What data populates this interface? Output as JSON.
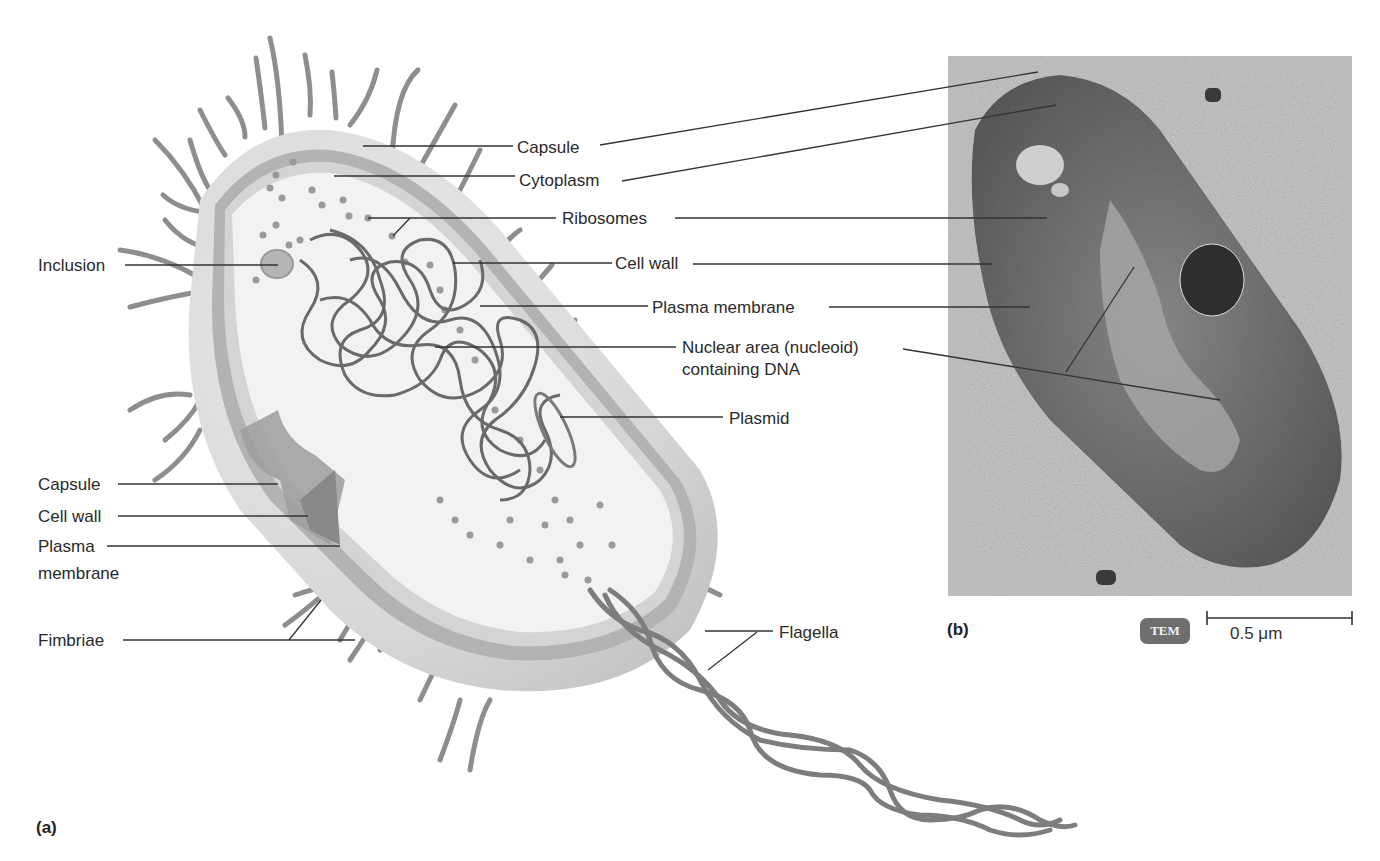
{
  "figure": {
    "panel_a_label": "(a)",
    "panel_b_label": "(b)",
    "diagram_labels": {
      "capsule_top": "Capsule",
      "cytoplasm": "Cytoplasm",
      "ribosomes": "Ribosomes",
      "inclusion": "Inclusion",
      "cell_wall_top": "Cell wall",
      "plasma_membrane_top": "Plasma membrane",
      "nucleoid_line1": "Nuclear area (nucleoid)",
      "nucleoid_line2": "containing DNA",
      "plasmid": "Plasmid",
      "capsule_bottom": "Capsule",
      "cell_wall_bottom": "Cell wall",
      "plasma_membrane_bottom_line1": "Plasma",
      "plasma_membrane_bottom_line2": "membrane",
      "fimbriae": "Fimbriae",
      "flagella": "Flagella"
    },
    "micrograph": {
      "technique_badge": "TEM",
      "scale_bar_label": "0.5 μm"
    },
    "colors": {
      "label_text": "#2a2a2a",
      "leader_line": "#333333",
      "capsule": "#d9d9d9",
      "cell_wall": "#a9a9a9",
      "cytoplasm": "#f1f1f1",
      "dna": "#666666",
      "micrograph_bg": "#b9b9b9",
      "micrograph_cell": "#6f6f6f",
      "tem_badge": "#6e6e6e"
    }
  }
}
